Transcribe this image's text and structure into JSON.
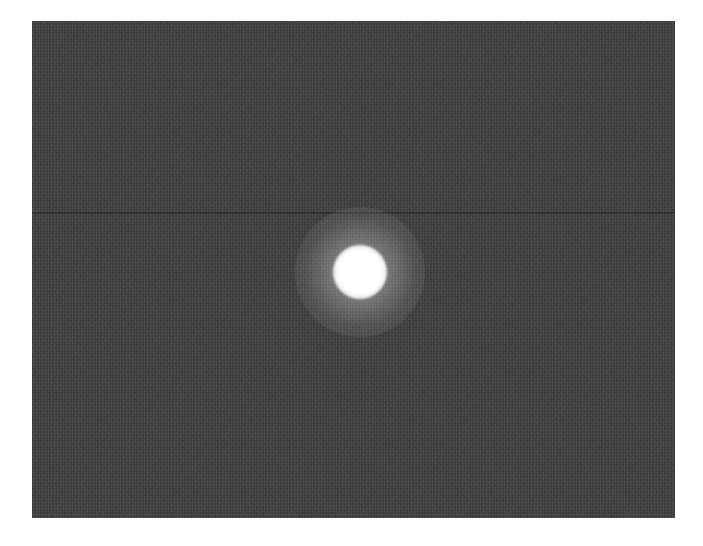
{
  "image": {
    "description": "Grayscale photograph of a single bright light spot on a dark noisy background",
    "background_color": "#464646",
    "frame": {
      "left": 32,
      "top": 21,
      "width": 643,
      "height": 497
    },
    "horizontal_lines": [
      {
        "y": 191
      }
    ],
    "spot": {
      "center_x": 328,
      "center_y": 251,
      "core_diameter": 54,
      "glow_diameter": 130,
      "color": "#ffffff"
    }
  }
}
